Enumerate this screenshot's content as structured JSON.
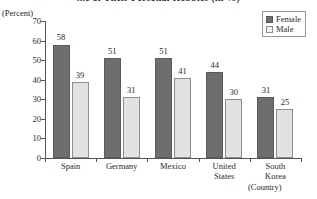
{
  "chart_data": {
    "type": "bar",
    "title": "...e of Their Personal Hobbies (in %)",
    "ylabel": "(Percent)",
    "xlabel": "(Country)",
    "ylim": [
      0,
      70
    ],
    "yticks": [
      0,
      10,
      20,
      30,
      40,
      50,
      60,
      70
    ],
    "grid": false,
    "legend_position": "top-right",
    "categories": [
      "Spain",
      "Germany",
      "Mexico",
      "United States",
      "South Korea"
    ],
    "series": [
      {
        "name": "Female",
        "color": "#6e6e6e",
        "values": [
          58,
          51,
          51,
          44,
          31
        ]
      },
      {
        "name": "Male",
        "color": "#e2e2e2",
        "values": [
          39,
          31,
          41,
          30,
          25
        ]
      }
    ]
  },
  "ytick_labels": [
    "70",
    "60",
    "50",
    "40",
    "30",
    "20",
    "10",
    "0"
  ],
  "categories_display": [
    "Spain",
    "Germany",
    "Mexico",
    "United\nStates",
    "South\nKorea"
  ],
  "values_female": [
    "58",
    "51",
    "51",
    "44",
    "31"
  ],
  "values_male": [
    "39",
    "31",
    "41",
    "30",
    "25"
  ],
  "legend": {
    "female_label": "Female",
    "male_label": "Male"
  }
}
